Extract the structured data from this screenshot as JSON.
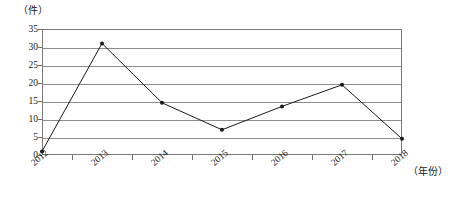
{
  "chart_data": {
    "type": "line",
    "title": "",
    "xlabel": "（年份）",
    "ylabel": "（件）",
    "categories": [
      "2012",
      "2013",
      "2014",
      "2015",
      "2016",
      "2017",
      "2018"
    ],
    "values": [
      1,
      31,
      14.5,
      7,
      13.5,
      19.5,
      4.5
    ],
    "series": [
      {
        "name": "件数",
        "values": [
          1,
          31,
          14.5,
          7,
          13.5,
          19.5,
          4.5
        ]
      }
    ],
    "ylim": [
      0,
      35
    ],
    "yticks": [
      0,
      5,
      10,
      15,
      20,
      25,
      30,
      35
    ],
    "ytick_labels": [
      "0",
      "5",
      "10",
      "15",
      "20",
      "25",
      "30",
      "35"
    ],
    "grid": true,
    "legend": "none",
    "marker": "filled-circle",
    "line_color": "#1a1a1a",
    "grid_color": "#8d8d8d",
    "axis_color": "#7a7a7a"
  },
  "axes": {
    "y_unit_label": "（件）",
    "x_unit_label": "（年份）"
  }
}
